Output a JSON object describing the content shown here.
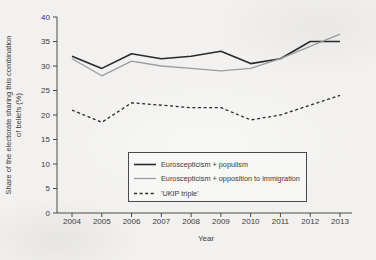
{
  "figure_title": "",
  "axes": {
    "ylabel_line1": "Share of the electorate sharing this combination",
    "ylabel_line2": "of beliefs (%)",
    "xlabel": "Year"
  },
  "legend": {
    "items": [
      {
        "label": "Euroscepticism + populism",
        "style": "solid",
        "color": "#2a2a2a"
      },
      {
        "label": "Euroscepticism + opposition to immigration",
        "style": "solid",
        "color": "#9c9c9c"
      },
      {
        "label": "'UKIP triple'",
        "style": "dashed",
        "color": "#2a2a2a"
      }
    ]
  },
  "chart_data": {
    "type": "line",
    "title": "",
    "xlabel": "Year",
    "ylabel": "Share of the electorate sharing this combination of beliefs (%)",
    "categories": [
      2004,
      2005,
      2006,
      2007,
      2008,
      2009,
      2010,
      2011,
      2012,
      2013
    ],
    "ylim": [
      0,
      40
    ],
    "ytick_step": 5,
    "grid": false,
    "legend_position": "inside-lower-right",
    "series": [
      {
        "name": "Euroscepticism + populism",
        "color": "#2a2a2a",
        "style": "solid",
        "values": [
          32,
          29.5,
          32.5,
          31.5,
          32,
          33,
          30.5,
          31.5,
          35,
          35
        ]
      },
      {
        "name": "Euroscepticism + opposition to immigration",
        "color": "#9c9c9c",
        "style": "solid",
        "values": [
          31.5,
          28,
          31,
          30,
          29.5,
          29,
          29.5,
          31.5,
          34,
          36.5
        ]
      },
      {
        "name": "'UKIP triple'",
        "color": "#2a2a2a",
        "style": "dashed",
        "values": [
          21,
          18.5,
          22.5,
          22,
          21.5,
          21.5,
          19,
          20,
          22,
          24
        ]
      }
    ]
  }
}
